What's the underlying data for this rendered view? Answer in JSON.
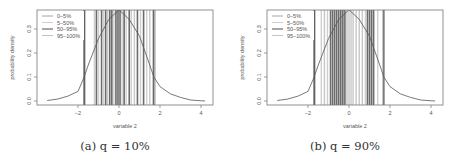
{
  "chart_data": [
    {
      "type": "line",
      "title": "",
      "caption": "(a) q = 10%",
      "xlabel": "variable 2",
      "ylabel": "probability density",
      "xlim": [
        -3.9,
        4.6
      ],
      "ylim": [
        -0.015,
        0.38
      ],
      "xticks": [
        -2,
        0,
        2,
        4
      ],
      "yticks": [
        0.0,
        0.1,
        0.2,
        0.3
      ],
      "ytick_labels": [
        "0.0",
        "0.1",
        "0.2",
        "0.3"
      ],
      "grid": false,
      "legend_position": "top-left",
      "legend": [
        {
          "label": "0–5%",
          "color": "#9a9a9a"
        },
        {
          "label": "5–50%",
          "color": "#c8c8c8"
        },
        {
          "label": "50–95%",
          "color": "#3a3a3a"
        },
        {
          "label": "95–100%",
          "color": "#bdbdbd"
        }
      ],
      "density_curve": {
        "x": [
          -3.5,
          -3.0,
          -2.5,
          -2.0,
          -1.7,
          -1.5,
          -1.0,
          -0.5,
          0.0,
          0.5,
          1.0,
          1.5,
          1.7,
          2.0,
          2.5,
          3.0,
          3.5,
          4.0,
          4.2
        ],
        "y": [
          0.002,
          0.008,
          0.02,
          0.04,
          0.1,
          0.15,
          0.26,
          0.34,
          0.38,
          0.34,
          0.27,
          0.15,
          0.1,
          0.06,
          0.03,
          0.015,
          0.004,
          0.001,
          0.0
        ]
      },
      "vertical_lines": [
        {
          "x": -1.72,
          "group": "0–5%"
        },
        {
          "x": -1.68,
          "group": "50–95%"
        },
        {
          "x": -1.2,
          "group": "5–50%"
        },
        {
          "x": -1.1,
          "group": "50–95%"
        },
        {
          "x": -1.0,
          "group": "5–50%"
        },
        {
          "x": -0.85,
          "group": "50–95%"
        },
        {
          "x": -0.75,
          "group": "5–50%"
        },
        {
          "x": -0.65,
          "group": "50–95%"
        },
        {
          "x": -0.55,
          "group": "95–100%"
        },
        {
          "x": -0.45,
          "group": "50–95%"
        },
        {
          "x": -0.35,
          "group": "50–95%"
        },
        {
          "x": -0.25,
          "group": "5–50%"
        },
        {
          "x": -0.15,
          "group": "50–95%"
        },
        {
          "x": -0.05,
          "group": "50–95%"
        },
        {
          "x": 0.05,
          "group": "50–95%"
        },
        {
          "x": 0.15,
          "group": "5–50%"
        },
        {
          "x": 0.25,
          "group": "50–95%"
        },
        {
          "x": 0.35,
          "group": "5–50%"
        },
        {
          "x": 0.5,
          "group": "50–95%"
        },
        {
          "x": 0.6,
          "group": "5–50%"
        },
        {
          "x": 0.75,
          "group": "95–100%"
        },
        {
          "x": 0.9,
          "group": "50–95%"
        },
        {
          "x": 1.05,
          "group": "5–50%"
        },
        {
          "x": 1.2,
          "group": "50–95%"
        },
        {
          "x": 1.35,
          "group": "5–50%"
        },
        {
          "x": 1.5,
          "group": "95–100%"
        },
        {
          "x": 1.68,
          "group": "50–95%"
        },
        {
          "x": 1.75,
          "group": "0–5%"
        }
      ]
    },
    {
      "type": "line",
      "title": "",
      "caption": "(b) q = 90%",
      "xlabel": "variable 2",
      "ylabel": "probability density",
      "xlim": [
        -3.9,
        4.6
      ],
      "ylim": [
        -0.015,
        0.38
      ],
      "xticks": [
        -2,
        0,
        2,
        4
      ],
      "yticks": [
        0.0,
        0.1,
        0.2,
        0.3
      ],
      "ytick_labels": [
        "0.0",
        "0.1",
        "0.2",
        "0.3"
      ],
      "grid": false,
      "legend_position": "top-left",
      "legend": [
        {
          "label": "0–5%",
          "color": "#9a9a9a"
        },
        {
          "label": "5–50%",
          "color": "#c8c8c8"
        },
        {
          "label": "50–95%",
          "color": "#3a3a3a"
        },
        {
          "label": "95–100%",
          "color": "#bdbdbd"
        }
      ],
      "density_curve": {
        "x": [
          -3.5,
          -3.0,
          -2.5,
          -2.0,
          -1.7,
          -1.5,
          -1.0,
          -0.5,
          0.0,
          0.5,
          1.0,
          1.5,
          1.7,
          2.0,
          2.5,
          3.0,
          3.5,
          4.0,
          4.2
        ],
        "y": [
          0.002,
          0.008,
          0.02,
          0.04,
          0.1,
          0.15,
          0.26,
          0.34,
          0.38,
          0.34,
          0.27,
          0.15,
          0.1,
          0.06,
          0.03,
          0.015,
          0.004,
          0.001,
          0.0
        ]
      },
      "vertical_lines": [
        {
          "x": -1.72,
          "group": "0–5%"
        },
        {
          "x": -1.68,
          "group": "50–95%"
        },
        {
          "x": -1.35,
          "group": "5–50%"
        },
        {
          "x": -1.2,
          "group": "95–100%"
        },
        {
          "x": -1.05,
          "group": "5–50%"
        },
        {
          "x": -0.9,
          "group": "50–95%"
        },
        {
          "x": -0.8,
          "group": "50–95%"
        },
        {
          "x": -0.7,
          "group": "50–95%"
        },
        {
          "x": -0.6,
          "group": "50–95%"
        },
        {
          "x": -0.5,
          "group": "50–95%"
        },
        {
          "x": -0.4,
          "group": "50–95%"
        },
        {
          "x": -0.3,
          "group": "50–95%"
        },
        {
          "x": -0.2,
          "group": "50–95%"
        },
        {
          "x": -0.1,
          "group": "95–100%"
        },
        {
          "x": 0.0,
          "group": "95–100%"
        },
        {
          "x": 0.1,
          "group": "95–100%"
        },
        {
          "x": 0.2,
          "group": "95–100%"
        },
        {
          "x": 0.35,
          "group": "95–100%"
        },
        {
          "x": 0.5,
          "group": "95–100%"
        },
        {
          "x": 0.65,
          "group": "95–100%"
        },
        {
          "x": 0.8,
          "group": "5–50%"
        },
        {
          "x": 0.9,
          "group": "50–95%"
        },
        {
          "x": 1.0,
          "group": "50–95%"
        },
        {
          "x": 1.1,
          "group": "50–95%"
        },
        {
          "x": 1.2,
          "group": "50–95%"
        },
        {
          "x": 1.4,
          "group": "5–50%"
        },
        {
          "x": 1.68,
          "group": "50–95%"
        },
        {
          "x": 1.72,
          "group": "0–5%"
        }
      ]
    }
  ],
  "panels": [
    {
      "caption": "(a) q = 10%",
      "xlabel": "variable 2",
      "ylabel": "probability density"
    },
    {
      "caption": "(b) q = 90%",
      "xlabel": "variable 2",
      "ylabel": "probability density"
    }
  ]
}
